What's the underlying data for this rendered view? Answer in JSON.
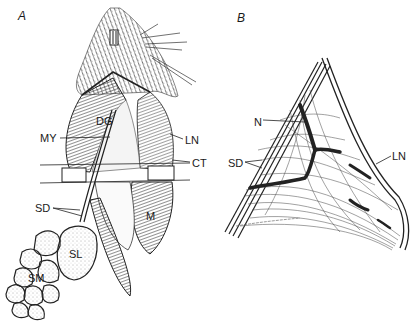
{
  "figure": {
    "panels": [
      {
        "id": "A",
        "label": "A",
        "annotations": [
          {
            "text": "DG",
            "x": 96,
            "y": 125
          },
          {
            "text": "MY",
            "x": 42,
            "y": 141
          },
          {
            "text": "LN",
            "x": 187,
            "y": 143
          },
          {
            "text": "CT",
            "x": 193,
            "y": 166
          },
          {
            "text": "SD",
            "x": 37,
            "y": 211
          },
          {
            "text": "M",
            "x": 146,
            "y": 220
          },
          {
            "text": "SL",
            "x": 69,
            "y": 258
          },
          {
            "text": "SM",
            "x": 29,
            "y": 282
          }
        ]
      },
      {
        "id": "B",
        "label": "B",
        "annotations": [
          {
            "text": "N",
            "x": 256,
            "y": 125
          },
          {
            "text": "SD",
            "x": 230,
            "y": 167
          },
          {
            "text": "LN",
            "x": 393,
            "y": 160
          }
        ]
      }
    ],
    "colors": {
      "ink": "#1a1a1a",
      "background": "#ffffff",
      "shade": "#6b6b6b"
    }
  }
}
